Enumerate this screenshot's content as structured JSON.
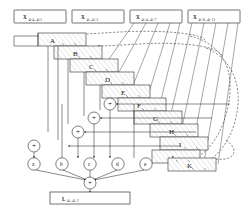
{
  "diagram": {
    "input_registers": [
      {
        "name": "X",
        "subscript": "4i-4...4i-1"
      },
      {
        "name": "X",
        "subscript": "4i...4i+3"
      },
      {
        "name": "X",
        "subscript": "4i+4...4i+7"
      },
      {
        "name": "X",
        "subscript": "4i+8...4i+11"
      }
    ],
    "output_register": {
      "name": "L",
      "subscript": "4i...4i+3"
    },
    "stage_boxes": [
      {
        "label": "A"
      },
      {
        "label": "B"
      },
      {
        "label": "C"
      },
      {
        "label": "D"
      },
      {
        "label": "E"
      },
      {
        "label": "F"
      },
      {
        "label": "G"
      },
      {
        "label": "H"
      },
      {
        "label": "I"
      },
      {
        "label": "J"
      },
      {
        "label": "K"
      }
    ],
    "sum_nodes": [
      {
        "label": "a"
      },
      {
        "label": "b"
      },
      {
        "label": "c"
      },
      {
        "label": "d"
      },
      {
        "label": "e"
      }
    ],
    "adder_symbol": "+",
    "adder_count": 5,
    "final_adder_symbol": "+",
    "colors": {
      "line": "#2a2a2a",
      "hatch": "#8c8c8c",
      "background": "#ffffff",
      "text": "#111111"
    }
  }
}
